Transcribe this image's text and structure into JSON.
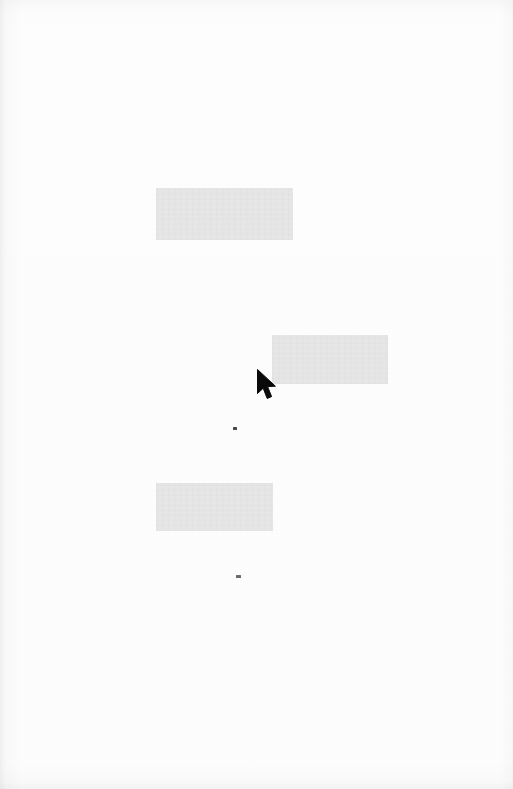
{
  "page": {
    "width": 513,
    "height": 789,
    "background_color": "#fdfdfd",
    "description": ""
  },
  "blocks": [
    {
      "name": "redaction-block-top",
      "color": "#e6e6e6",
      "x": 156,
      "y": 188,
      "width": 137,
      "height": 52,
      "text": ""
    },
    {
      "name": "redaction-block-middle",
      "color": "#e6e6e6",
      "x": 272,
      "y": 335,
      "width": 116,
      "height": 49,
      "text": ""
    },
    {
      "name": "redaction-block-bottom",
      "color": "#e6e6e6",
      "x": 156,
      "y": 483,
      "width": 117,
      "height": 48,
      "text": ""
    }
  ],
  "specks": [
    {
      "name": "speck-upper",
      "color": "#4a4a4a",
      "x": 233,
      "y": 427,
      "width": 4,
      "height": 3
    },
    {
      "name": "speck-lower",
      "color": "#6a6a6a",
      "x": 236,
      "y": 575,
      "width": 5,
      "height": 3
    }
  ],
  "cursor": {
    "name": "mouse-cursor",
    "type": "arrow-pointer",
    "color": "#0a0a0a",
    "tip_x": 257,
    "tip_y": 369,
    "width": 21,
    "height": 32
  }
}
